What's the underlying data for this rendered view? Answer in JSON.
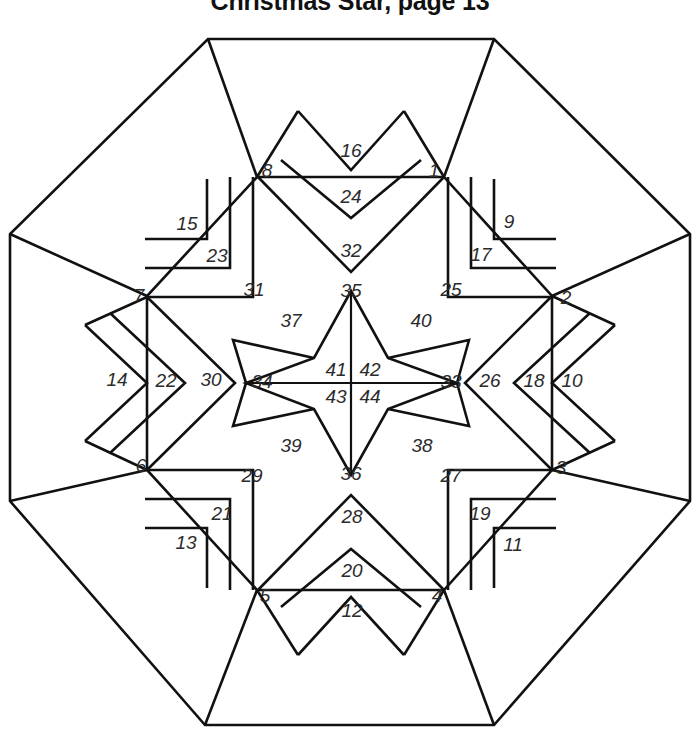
{
  "document": {
    "title": "Christmas Star, page 13"
  },
  "pattern": {
    "name": "christmas-star-quilt-block",
    "shape": "octagon",
    "line_color": "#111111",
    "background_color": "#ffffff",
    "number_color": "#2b2b2b",
    "total_pieces": 44
  },
  "pieces": [
    {
      "id": 1,
      "label": "1",
      "x": 434,
      "y": 172
    },
    {
      "id": 2,
      "label": "2",
      "x": 566,
      "y": 299
    },
    {
      "id": 3,
      "label": "3",
      "x": 561,
      "y": 469
    },
    {
      "id": 4,
      "label": "4",
      "x": 437,
      "y": 597
    },
    {
      "id": 5,
      "label": "5",
      "x": 265,
      "y": 597
    },
    {
      "id": 6,
      "label": "6",
      "x": 141,
      "y": 467
    },
    {
      "id": 7,
      "label": "7",
      "x": 139,
      "y": 297
    },
    {
      "id": 8,
      "label": "8",
      "x": 267,
      "y": 172
    },
    {
      "id": 9,
      "label": "9",
      "x": 509,
      "y": 223
    },
    {
      "id": 10,
      "label": "10",
      "x": 572,
      "y": 382
    },
    {
      "id": 11,
      "label": "11",
      "x": 513,
      "y": 546
    },
    {
      "id": 12,
      "label": "12",
      "x": 352,
      "y": 612
    },
    {
      "id": 13,
      "label": "13",
      "x": 186,
      "y": 544
    },
    {
      "id": 14,
      "label": "14",
      "x": 117,
      "y": 381
    },
    {
      "id": 15,
      "label": "15",
      "x": 187,
      "y": 225
    },
    {
      "id": 16,
      "label": "16",
      "x": 351,
      "y": 152
    },
    {
      "id": 17,
      "label": "17",
      "x": 481,
      "y": 256
    },
    {
      "id": 18,
      "label": "18",
      "x": 534,
      "y": 382
    },
    {
      "id": 19,
      "label": "19",
      "x": 480,
      "y": 515
    },
    {
      "id": 20,
      "label": "20",
      "x": 352,
      "y": 572
    },
    {
      "id": 21,
      "label": "21",
      "x": 222,
      "y": 515
    },
    {
      "id": 22,
      "label": "22",
      "x": 166,
      "y": 382
    },
    {
      "id": 23,
      "label": "23",
      "x": 217,
      "y": 257
    },
    {
      "id": 24,
      "label": "24",
      "x": 351,
      "y": 198
    },
    {
      "id": 25,
      "label": "25",
      "x": 451,
      "y": 291
    },
    {
      "id": 26,
      "label": "26",
      "x": 490,
      "y": 382
    },
    {
      "id": 27,
      "label": "27",
      "x": 451,
      "y": 477
    },
    {
      "id": 28,
      "label": "28",
      "x": 352,
      "y": 518
    },
    {
      "id": 29,
      "label": "29",
      "x": 252,
      "y": 477
    },
    {
      "id": 30,
      "label": "30",
      "x": 211,
      "y": 381
    },
    {
      "id": 31,
      "label": "31",
      "x": 254,
      "y": 291
    },
    {
      "id": 32,
      "label": "32",
      "x": 351,
      "y": 252
    },
    {
      "id": 33,
      "label": "33",
      "x": 451,
      "y": 383
    },
    {
      "id": 34,
      "label": "34",
      "x": 262,
      "y": 383
    },
    {
      "id": 35,
      "label": "35",
      "x": 351,
      "y": 292
    },
    {
      "id": 36,
      "label": "36",
      "x": 351,
      "y": 475
    },
    {
      "id": 37,
      "label": "37",
      "x": 291,
      "y": 322
    },
    {
      "id": 38,
      "label": "38",
      "x": 422,
      "y": 447
    },
    {
      "id": 39,
      "label": "39",
      "x": 291,
      "y": 447
    },
    {
      "id": 40,
      "label": "40",
      "x": 421,
      "y": 322
    },
    {
      "id": 41,
      "label": "41",
      "x": 336,
      "y": 371
    },
    {
      "id": 42,
      "label": "42",
      "x": 370,
      "y": 371
    },
    {
      "id": 43,
      "label": "43",
      "x": 336,
      "y": 398
    },
    {
      "id": 44,
      "label": "44",
      "x": 370,
      "y": 398
    }
  ],
  "geometry": {
    "octagon": "M 208,39 L 494,39 L 690,234 L 690,501 L 494,725 L 205,725 L 10,501 L 10,234 Z",
    "inner_ring": "M 208,39 L 257,177 M 494,39 L 444,177 M 690,234 L 552,296 M 690,501 L 552,470 M 494,725 L 444,590 M 205,725 L 257,590 M 10,501 L 147,470 M 10,234 L 147,296",
    "star_outer": "M 351,291 L 388,358 L 457,383 L 388,409 L 351,475 L 314,409 L 246,383 L 314,358 Z",
    "center_cross": "M 351,291 L 351,475 M 246,383 L 457,383"
  }
}
